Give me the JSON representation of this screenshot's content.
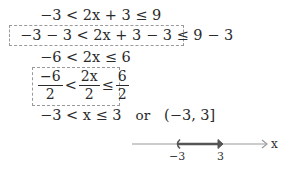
{
  "steps": {
    "step1": "−3 < 2x + 3 ≤ 9",
    "step2": "−3 − 3 < 2x + 3 − 3 ≤ 9 − 3",
    "step3": "−6 < 2x ≤ 6",
    "step4": {
      "left": {
        "num": "−6",
        "den": "2"
      },
      "op1": "<",
      "middle": {
        "num": "2x",
        "den": "2"
      },
      "op2": "≤",
      "right": {
        "num": "6",
        "den": "2"
      }
    },
    "step5": {
      "inequality": "−3 < x ≤ 3",
      "connector": "or",
      "interval": "(−3, 3]"
    }
  },
  "number_line": {
    "axis_label": "x",
    "ticks": [
      "−3",
      "3"
    ],
    "interval_start": -3,
    "interval_end": 3,
    "left_endpoint": "open",
    "right_endpoint": "closed",
    "line_color": "#9a9a9a",
    "segment_color": "#555555"
  }
}
